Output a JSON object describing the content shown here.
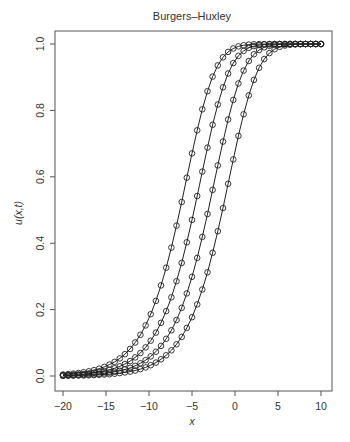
{
  "chart_data": {
    "type": "line",
    "title": "Burgers–Huxley",
    "xlabel": "x",
    "ylabel": "u(x,t)",
    "xlim": [
      -20,
      10
    ],
    "ylim": [
      0,
      1
    ],
    "xticks": [
      -20,
      -15,
      -10,
      -5,
      0,
      5,
      10
    ],
    "xtick_labels": [
      "−20",
      "−15",
      "−10",
      "−5",
      "0",
      "5",
      "10"
    ],
    "yticks": [
      0,
      0.2,
      0.4,
      0.6,
      0.8,
      1.0
    ],
    "ytick_labels": [
      "0.0",
      "0.2",
      "0.4",
      "0.6",
      "0.8",
      "1.0"
    ],
    "grid": false,
    "legend": null,
    "marker": "open-circle",
    "line_color": "#222222",
    "x": [
      -20,
      -19.4,
      -18.8,
      -18.2,
      -17.6,
      -17,
      -16.4,
      -15.8,
      -15.2,
      -14.6,
      -14,
      -13.4,
      -12.8,
      -12.2,
      -11.6,
      -11,
      -10.4,
      -9.8,
      -9.2,
      -8.6,
      -8,
      -7.4,
      -6.8,
      -6.2,
      -5.6,
      -5,
      -4.4,
      -3.8,
      -3.2,
      -2.6,
      -2,
      -1.4,
      -0.8,
      -0.2,
      0.4,
      1,
      1.6,
      2.2,
      2.8,
      3.4,
      4,
      4.6,
      5.2,
      5.8,
      6.4,
      7,
      7.6,
      8.2,
      8.8,
      9.4,
      10
    ],
    "series": [
      {
        "name": "t1",
        "values": [
          0.0046,
          0.0058,
          0.0072,
          0.009,
          0.0113,
          0.0141,
          0.0176,
          0.022,
          0.0274,
          0.0342,
          0.0426,
          0.053,
          0.0658,
          0.0815,
          0.1008,
          0.1242,
          0.1524,
          0.1862,
          0.2262,
          0.2729,
          0.3263,
          0.3867,
          0.4529,
          0.524,
          0.5974,
          0.6704,
          0.74,
          0.8033,
          0.8577,
          0.9018,
          0.9356,
          0.9598,
          0.9762,
          0.9865,
          0.9927,
          0.9962,
          0.9981,
          0.9991,
          0.9996,
          0.9998,
          0.9999,
          1.0,
          1.0,
          1.0,
          1.0,
          1.0,
          1.0,
          1.0,
          1.0,
          1.0,
          1.0
        ]
      },
      {
        "name": "t2",
        "values": [
          0.0025,
          0.0031,
          0.0039,
          0.0049,
          0.0061,
          0.0076,
          0.0095,
          0.0119,
          0.0149,
          0.0186,
          0.0232,
          0.029,
          0.0361,
          0.045,
          0.0559,
          0.0694,
          0.086,
          0.1062,
          0.1307,
          0.1602,
          0.1955,
          0.2371,
          0.2855,
          0.3408,
          0.4027,
          0.4702,
          0.5422,
          0.6158,
          0.6881,
          0.7565,
          0.8177,
          0.8697,
          0.9112,
          0.9425,
          0.9646,
          0.9792,
          0.9884,
          0.9938,
          0.9968,
          0.9984,
          0.9992,
          0.9997,
          0.9999,
          1.0,
          1.0,
          1.0,
          1.0,
          1.0,
          1.0,
          1.0,
          1.0
        ]
      },
      {
        "name": "t3",
        "values": [
          0.0013,
          0.0017,
          0.0021,
          0.0026,
          0.0033,
          0.0041,
          0.0052,
          0.0065,
          0.0081,
          0.0101,
          0.0126,
          0.0157,
          0.0197,
          0.0245,
          0.0306,
          0.0382,
          0.0475,
          0.059,
          0.0733,
          0.0907,
          0.1119,
          0.1376,
          0.1686,
          0.2054,
          0.2487,
          0.2988,
          0.3557,
          0.4191,
          0.488,
          0.5604,
          0.6342,
          0.7059,
          0.7726,
          0.8317,
          0.8811,
          0.92,
          0.9488,
          0.9689,
          0.982,
          0.99,
          0.9947,
          0.9973,
          0.9987,
          0.9994,
          0.9997,
          0.9999,
          1.0,
          1.0,
          1.0,
          1.0,
          1.0
        ]
      },
      {
        "name": "t4",
        "values": [
          0.0007,
          0.0009,
          0.0011,
          0.0014,
          0.0018,
          0.0022,
          0.0028,
          0.0035,
          0.0044,
          0.0055,
          0.0068,
          0.0086,
          0.0107,
          0.0133,
          0.0167,
          0.0208,
          0.026,
          0.0324,
          0.0404,
          0.0502,
          0.0623,
          0.0773,
          0.0956,
          0.1179,
          0.1449,
          0.1772,
          0.2156,
          0.2605,
          0.3124,
          0.3711,
          0.4361,
          0.506,
          0.579,
          0.6524,
          0.7233,
          0.7883,
          0.8451,
          0.8918,
          0.9282,
          0.9546,
          0.9727,
          0.9844,
          0.9915,
          0.9955,
          0.9978,
          0.9989,
          0.9995,
          0.9998,
          0.9999,
          1.0,
          1.0
        ]
      }
    ]
  }
}
